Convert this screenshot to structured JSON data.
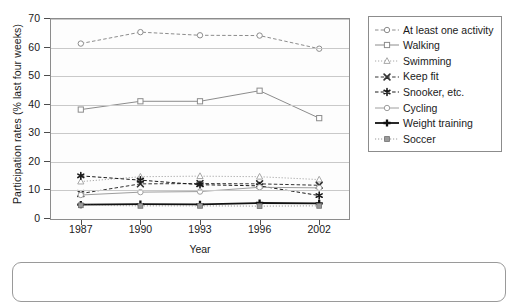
{
  "chart_data": {
    "type": "line",
    "title": "",
    "xlabel": "Year",
    "ylabel": "Participation rates (% last four weeks)",
    "x": [
      "1987",
      "1990",
      "1993",
      "1996",
      "2002"
    ],
    "categories": [
      "1987",
      "1990",
      "1993",
      "1996",
      "2002"
    ],
    "ylim": [
      0,
      70
    ],
    "yticks": [
      0,
      10,
      20,
      30,
      40,
      50,
      60,
      70
    ],
    "ytick_labels": [
      "0",
      "10",
      "20",
      "30",
      "40",
      "50",
      "60",
      "70"
    ],
    "grid": true,
    "legend_position": "right",
    "series": [
      {
        "name": "At least one activity",
        "marker": "circle-open",
        "line": "dashed",
        "color": "#8c8c8c",
        "values": [
          61.4,
          65.4,
          64.3,
          64.2,
          59.6
        ]
      },
      {
        "name": "Walking",
        "marker": "square-open",
        "line": "solid",
        "color": "#8c8c8c",
        "values": [
          38.3,
          41.2,
          41.2,
          44.9,
          35.3
        ]
      },
      {
        "name": "Swimming",
        "marker": "triangle-open",
        "line": "dotted",
        "color": "#a8a8a8",
        "values": [
          13.1,
          14.8,
          15.0,
          14.8,
          13.8
        ]
      },
      {
        "name": "Keep fit",
        "marker": "x",
        "line": "dashed",
        "color": "#333333",
        "values": [
          8.9,
          12.3,
          12.4,
          12.3,
          11.8
        ]
      },
      {
        "name": "Snooker, etc.",
        "marker": "asterisk",
        "line": "dashed",
        "color": "#1a1a1a",
        "values": [
          15.1,
          13.6,
          12.0,
          11.6,
          8.2
        ]
      },
      {
        "name": "Cycling",
        "marker": "circle-open",
        "line": "solid",
        "color": "#9e9e9e",
        "values": [
          8.4,
          9.4,
          9.6,
          11.1,
          10.9
        ]
      },
      {
        "name": "Weight training",
        "marker": "plus",
        "line": "solid",
        "color": "#111111",
        "values": [
          5.0,
          5.2,
          5.1,
          5.6,
          5.5
        ]
      },
      {
        "name": "Soccer",
        "marker": "square-filled",
        "line": "dotted",
        "color": "#9a9a9a",
        "values": [
          4.8,
          4.6,
          4.6,
          4.5,
          4.6
        ]
      }
    ]
  },
  "axes": {
    "y_title": "Participation rates (% last four weeks)",
    "x_title": "Year",
    "y_tick_labels": [
      "70",
      "60",
      "50",
      "40",
      "30",
      "20",
      "10",
      "0"
    ],
    "x_tick_labels": [
      "1987",
      "1990",
      "1993",
      "1996",
      "2002"
    ]
  },
  "legend": {
    "items": [
      {
        "label": "At least one activity"
      },
      {
        "label": "Walking"
      },
      {
        "label": "Swimming"
      },
      {
        "label": "Keep fit"
      },
      {
        "label": "Snooker, etc."
      },
      {
        "label": "Cycling"
      },
      {
        "label": "Weight training"
      },
      {
        "label": "Soccer"
      }
    ]
  },
  "colors": {
    "grid": "#c9c9c9",
    "frame": "#8c8c8c",
    "text": "#1a1a1a",
    "plot_background": "#fdfdfd",
    "page_background": "#ffffff"
  }
}
